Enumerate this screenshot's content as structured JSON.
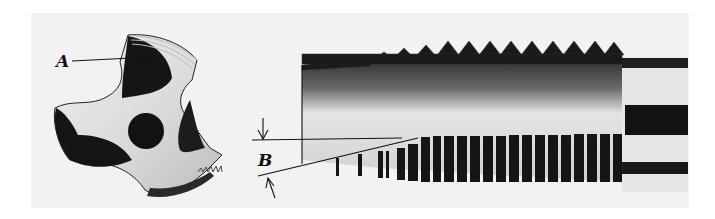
{
  "figure": {
    "labels": {
      "a": "A",
      "b": "B"
    },
    "colors": {
      "background": "#f2f2f2",
      "metal_dark": "#1a1a1a",
      "metal_light": "#e8e8e8",
      "line": "#111111"
    }
  }
}
